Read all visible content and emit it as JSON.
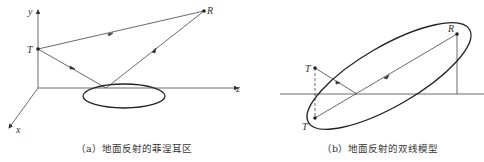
{
  "panels": [
    {
      "id": "a",
      "caption": "（a）地面反射的菲涅耳区",
      "labels": {
        "y_axis": "y",
        "z_axis": "z",
        "x_axis": "x",
        "transmitter": "T",
        "receiver": "R"
      }
    },
    {
      "id": "b",
      "caption": "（b）地面反射的双线模型",
      "labels": {
        "transmitter": "T",
        "image_transmitter": "T'",
        "receiver": "R"
      }
    }
  ],
  "colors": {
    "line": "#333333",
    "background": "#ffffff"
  }
}
